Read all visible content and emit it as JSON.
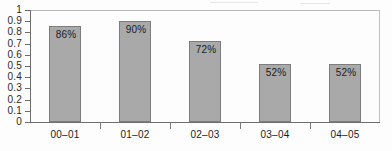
{
  "chart_data": {
    "type": "bar",
    "title": "",
    "xlabel": "",
    "ylabel": "",
    "categories": [
      "00–01",
      "01–02",
      "02–03",
      "03–04",
      "04–05"
    ],
    "values": [
      0.86,
      0.9,
      0.72,
      0.52,
      0.52
    ],
    "data_labels": [
      "86%",
      "90%",
      "72%",
      "52%",
      "52%"
    ],
    "ylim": [
      0,
      1
    ],
    "ytick_labels": [
      "1",
      "0.9",
      "0.8",
      "0.7",
      "0.6",
      "0.5",
      "0.4",
      "0.3",
      "0.2",
      "0.1",
      "0"
    ],
    "ytick_values": [
      1,
      0.9,
      0.8,
      0.7,
      0.6,
      0.5,
      0.4,
      0.3,
      0.2,
      0.1,
      0
    ],
    "grid": false,
    "legend": null,
    "bar_color": "#a9a9a9",
    "bar_border_color": "#7d7d7d",
    "axis_color": "#6e6e6e",
    "text_color": "#1c1c1c"
  }
}
